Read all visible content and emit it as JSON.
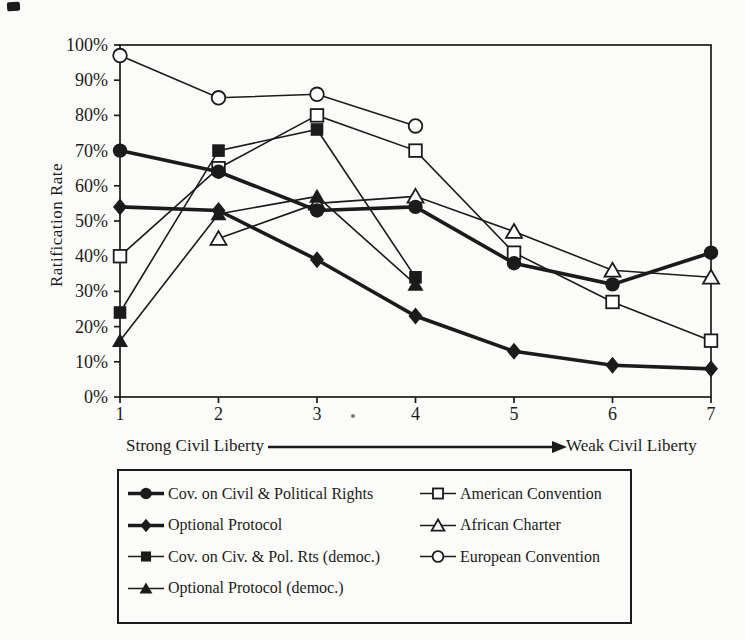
{
  "colors": {
    "ink": "#1b1b1b",
    "paper": "#fbfbf9",
    "marker_fill_open": "#ffffff"
  },
  "chart_data": {
    "type": "line",
    "title": "",
    "ylabel": "Ratification Rate",
    "xlabel": "",
    "ylim": [
      0,
      100
    ],
    "grid": false,
    "legend_position": "bottom-box",
    "x_categories": [
      "1",
      "2",
      "3",
      "4",
      "5",
      "6",
      "7"
    ],
    "y_ticks": [
      "0%",
      "10%",
      "20%",
      "30%",
      "40%",
      "50%",
      "60%",
      "70%",
      "80%",
      "90%",
      "100%"
    ],
    "x_axis_annotation": {
      "left": "Strong Civil Liberty",
      "right": "Weak Civil Liberty"
    },
    "series": [
      {
        "name": "Cov. on Civil & Political Rights",
        "marker": "filled-circle",
        "line": "thick",
        "z": 6,
        "values": [
          70,
          64,
          53,
          54,
          38,
          32,
          41
        ]
      },
      {
        "name": "Optional Protocol",
        "marker": "filled-diamond",
        "line": "thick",
        "z": 7,
        "values": [
          54,
          53,
          39,
          23,
          13,
          9,
          8
        ]
      },
      {
        "name": "Cov. on Civ. & Pol. Rts (democ.)",
        "marker": "filled-square",
        "line": "thin",
        "z": 4,
        "values": [
          24,
          70,
          76,
          34,
          null,
          null,
          null
        ]
      },
      {
        "name": "Optional Protocol (democ.)",
        "marker": "filled-triangle",
        "line": "thin",
        "z": 5,
        "values": [
          16,
          52,
          57,
          32,
          null,
          null,
          null
        ]
      },
      {
        "name": "American Convention",
        "marker": "open-square",
        "line": "thin",
        "z": 2,
        "values": [
          40,
          65,
          80,
          70,
          41,
          27,
          16
        ]
      },
      {
        "name": "African Charter",
        "marker": "open-triangle",
        "line": "thin",
        "z": 3,
        "values": [
          null,
          45,
          55,
          57,
          47,
          36,
          34
        ]
      },
      {
        "name": "European Convention",
        "marker": "open-circle",
        "line": "thin",
        "z": 1,
        "values": [
          97,
          85,
          86,
          77,
          null,
          null,
          null
        ]
      }
    ],
    "legend_columns": [
      [
        0,
        1,
        2,
        3
      ],
      [
        4,
        5,
        6
      ]
    ]
  }
}
